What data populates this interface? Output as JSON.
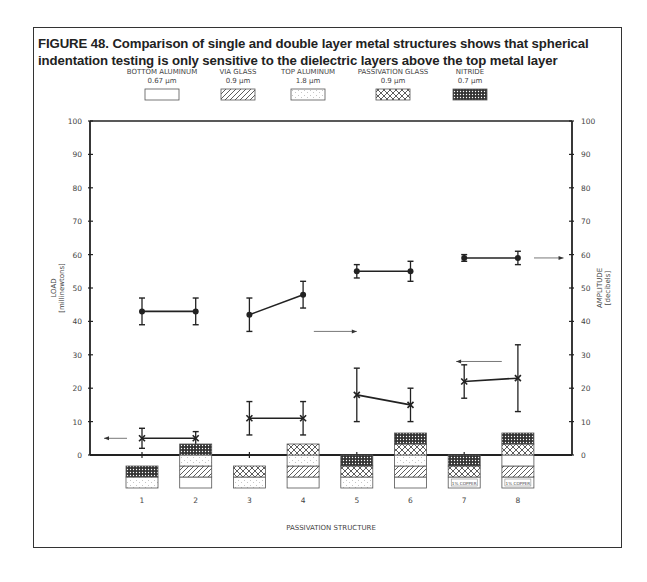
{
  "figure": {
    "title": "FIGURE 48. Comparison of single and double layer metal structures shows that spherical indentation testing is only sensitive to the dielectric layers above the top metal layer"
  },
  "legend": {
    "items": [
      {
        "name": "BOTTOM ALUMINUM",
        "thickness": "0.67 µm",
        "pattern": "blank"
      },
      {
        "name": "VIA GLASS",
        "thickness": "0.9 µm",
        "pattern": "diagonal"
      },
      {
        "name": "TOP ALUMINUM",
        "thickness": "1.8 µm",
        "pattern": "dots"
      },
      {
        "name": "PASSIVATION GLASS",
        "thickness": "0.9 µm",
        "pattern": "crosshatch"
      },
      {
        "name": "NITRIDE",
        "thickness": "0.7 µm",
        "pattern": "dense"
      }
    ]
  },
  "structures": [
    {
      "label": "1",
      "layers": [
        "dots",
        "dense"
      ]
    },
    {
      "label": "2",
      "layers": [
        "blank",
        "diagonal",
        "dots",
        "dense"
      ]
    },
    {
      "label": "3",
      "layers": [
        "dots",
        "crosshatch"
      ]
    },
    {
      "label": "4",
      "layers": [
        "blank",
        "diagonal",
        "dots",
        "crosshatch"
      ]
    },
    {
      "label": "5",
      "layers": [
        "dots",
        "crosshatch",
        "dense"
      ]
    },
    {
      "label": "6",
      "layers": [
        "blank",
        "diagonal",
        "dots",
        "crosshatch",
        "dense"
      ]
    },
    {
      "label": "7",
      "layers": [
        "copper",
        "crosshatch",
        "dense"
      ]
    },
    {
      "label": "8",
      "layers": [
        "copper",
        "diagonal",
        "blank",
        "crosshatch",
        "dense"
      ]
    }
  ],
  "copper_label": "1% COPPER",
  "chart_data": {
    "type": "line",
    "title": "FIGURE 48. Comparison of single and double layer metal structures shows that spherical indentation testing is only sensitive to the dielectric layers above the top metal layer",
    "xlabel": "PASSIVATION STRUCTURE",
    "ylabel": "LOAD (millinewtons)",
    "y2label": "AMPLITUDE (decibels)",
    "categories": [
      "1",
      "2",
      "3",
      "4",
      "5",
      "6",
      "7",
      "8"
    ],
    "ylim": [
      0,
      100
    ],
    "y2lim": [
      0,
      100
    ],
    "yticks": [
      0,
      10,
      20,
      30,
      40,
      50,
      60,
      70,
      80,
      90,
      100
    ],
    "grid": false,
    "series": [
      {
        "name": "Amplitude",
        "axis": "right",
        "marker": "circle",
        "values": [
          43,
          43,
          42,
          48,
          55,
          55,
          59,
          59
        ],
        "err_low": [
          39,
          39,
          37,
          44,
          53,
          52,
          58,
          57
        ],
        "err_high": [
          47,
          47,
          47,
          52,
          57,
          58,
          60,
          61
        ],
        "pairs": [
          [
            0,
            1
          ],
          [
            2,
            3
          ],
          [
            4,
            5
          ],
          [
            6,
            7
          ]
        ]
      },
      {
        "name": "Load",
        "axis": "left",
        "marker": "x",
        "values": [
          5,
          5,
          11,
          11,
          18,
          15,
          22,
          23
        ],
        "err_low": [
          2,
          3,
          6,
          6,
          10,
          10,
          17,
          13
        ],
        "err_high": [
          8,
          7,
          16,
          16,
          26,
          20,
          27,
          33
        ],
        "pairs": [
          [
            0,
            1
          ],
          [
            2,
            3
          ],
          [
            4,
            5
          ],
          [
            6,
            7
          ]
        ]
      }
    ],
    "annotations": [
      {
        "type": "arrow",
        "direction": "left",
        "y": 5,
        "x_from": 0.55,
        "x_to": 0.0,
        "meaning": "load series reads on left axis"
      },
      {
        "type": "arrow",
        "direction": "right",
        "y": 37,
        "x_from": 3.2,
        "x_to": 4.0,
        "meaning": "amplitude series reads on right axis"
      },
      {
        "type": "arrow",
        "direction": "right",
        "y": 59,
        "x_from": 7.3,
        "x_to": 7.85
      },
      {
        "type": "arrow",
        "direction": "left",
        "y": 28,
        "x_from": 6.7,
        "x_to": 5.85
      }
    ]
  }
}
